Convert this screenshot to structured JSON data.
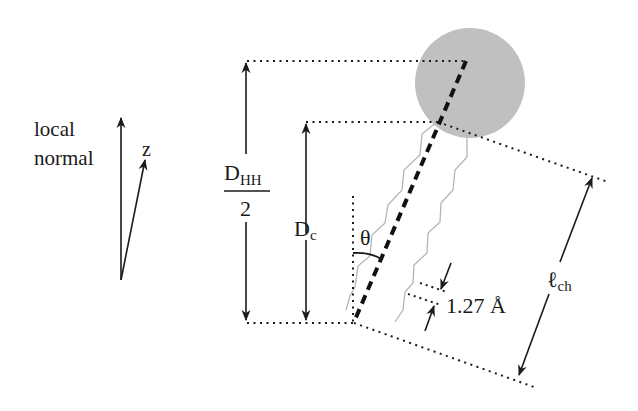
{
  "diagram": {
    "type": "lipid-chain-geometry",
    "labels": {
      "local_normal_line1": "local",
      "local_normal_line2": "normal",
      "z_axis": "z",
      "dhh_numerator_main": "D",
      "dhh_numerator_sub": "HH",
      "dhh_denominator": "2",
      "dc_main": "D",
      "dc_sub": "c",
      "theta": "θ",
      "spacing": "1.27 Å",
      "lch_main": "ℓ",
      "lch_sub": "ch"
    },
    "colors": {
      "headgroup_fill": "#bdbdbd",
      "chain_stroke": "#b5b5b5",
      "line_stroke": "#1a1a1a",
      "background": "#ffffff"
    }
  }
}
